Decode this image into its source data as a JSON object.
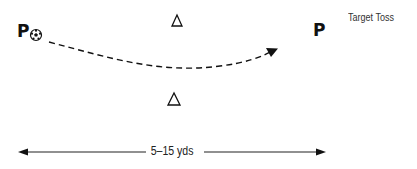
{
  "title": "Target Toss",
  "players": [
    {
      "id": "passer",
      "label": "P",
      "has_ball": true
    },
    {
      "id": "receiver",
      "label": "P",
      "has_ball": false
    }
  ],
  "cones": [
    {
      "id": "cone-top",
      "shape": "triangle-outline"
    },
    {
      "id": "cone-bottom",
      "shape": "triangle-outline"
    }
  ],
  "ball": {
    "icon": "soccer-ball-icon"
  },
  "pass_path": {
    "style": "dashed-curved-arrow",
    "from": "passer",
    "to": "receiver"
  },
  "distance": {
    "label": "5–15 yds",
    "style": "double-headed-arrow"
  },
  "colors": {
    "ink": "#111111",
    "text": "#333333",
    "background": "#ffffff"
  }
}
